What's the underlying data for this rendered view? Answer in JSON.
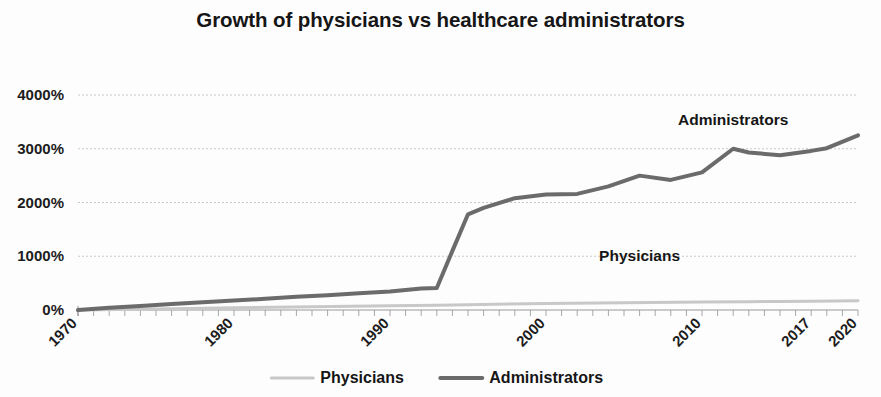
{
  "chart_data": {
    "type": "line",
    "title": "Growth of physicians vs healthcare administrators",
    "xlabel": "",
    "ylabel": "",
    "grid": true,
    "legend_position": "bottom",
    "xlim": [
      1970,
      2020
    ],
    "ylim": [
      0,
      4000
    ],
    "y_ticks": [
      0,
      1000,
      2000,
      3000,
      4000
    ],
    "y_tick_labels": [
      "0%",
      "1000%",
      "2000%",
      "3000%",
      "4000%"
    ],
    "x_ticks": [
      1970,
      1980,
      1990,
      2000,
      2010,
      2017,
      2020
    ],
    "x_tick_labels": [
      "1970",
      "1980",
      "1990",
      "2000",
      "2010",
      "2017",
      "2020"
    ],
    "x_minor_tick_step": 1,
    "annotations": [
      {
        "text": "Administrators",
        "x": 2012,
        "y": 3450
      },
      {
        "text": "Physicians",
        "x": 2006,
        "y": 920
      }
    ],
    "series": [
      {
        "name": "Physicians",
        "color": "#c8c8c8",
        "stroke_width": 3,
        "x": [
          1970,
          1975,
          1980,
          1985,
          1990,
          1993,
          1995,
          2000,
          2005,
          2010,
          2013,
          2015,
          2017,
          2020
        ],
        "values": [
          0,
          20,
          40,
          60,
          80,
          90,
          100,
          120,
          135,
          150,
          155,
          160,
          165,
          170
        ]
      },
      {
        "name": "Administrators",
        "color": "#6b6b6b",
        "stroke_width": 4,
        "x": [
          1970,
          1972,
          1974,
          1976,
          1978,
          1980,
          1982,
          1984,
          1986,
          1988,
          1990,
          1992,
          1993,
          1994,
          1995,
          1996,
          1998,
          2000,
          2002,
          2004,
          2006,
          2008,
          2010,
          2012,
          2013,
          2015,
          2017,
          2018,
          2020
        ],
        "values": [
          0,
          40,
          75,
          110,
          145,
          175,
          210,
          245,
          275,
          310,
          345,
          400,
          410,
          1100,
          1780,
          1900,
          2080,
          2150,
          2160,
          2300,
          2500,
          2420,
          2560,
          3000,
          2930,
          2880,
          2960,
          3010,
          3250
        ]
      }
    ]
  },
  "legend": {
    "items": [
      {
        "label": "Physicians",
        "color": "#c8c8c8"
      },
      {
        "label": "Administrators",
        "color": "#6b6b6b"
      }
    ]
  }
}
